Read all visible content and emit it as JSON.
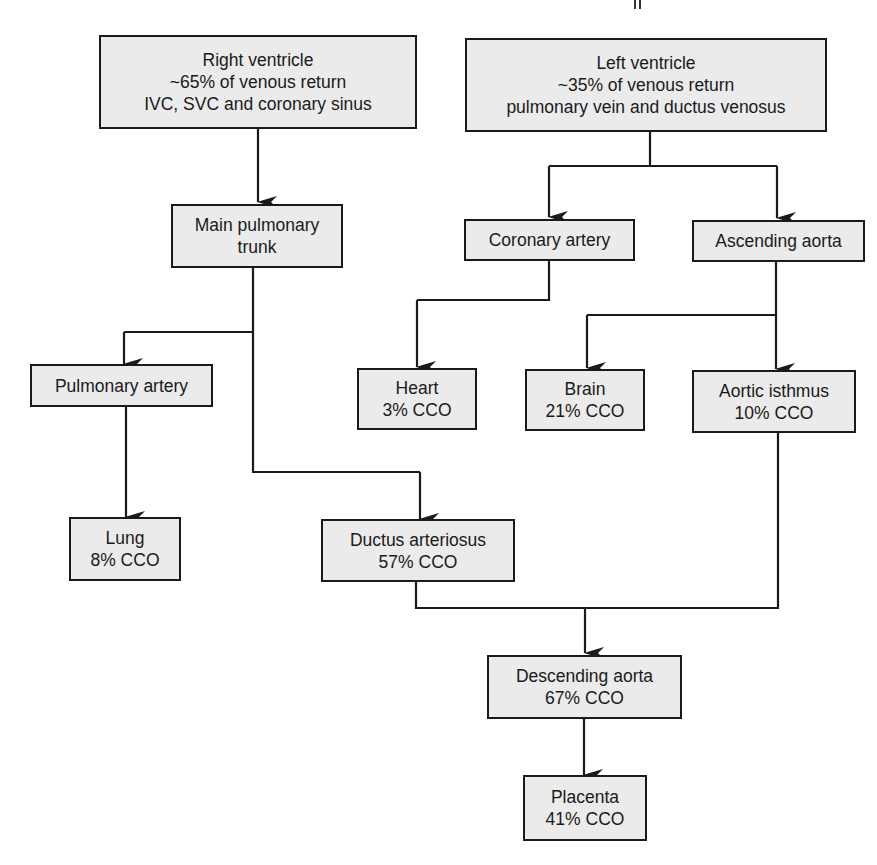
{
  "diagram": {
    "type": "flowchart",
    "topic": "Fetal circulation - distribution of combined cardiac output",
    "colors": {
      "box_fill": "#ebebeb",
      "box_border": "#1a1a1a",
      "line": "#1a1a1a",
      "text": "#1a1a1a",
      "background": "#ffffff"
    },
    "nodes": {
      "right_ventricle": {
        "lines": [
          "Right ventricle",
          "~65% of venous return",
          "IVC, SVC and coronary sinus"
        ]
      },
      "left_ventricle": {
        "lines": [
          "Left ventricle",
          "~35% of venous return",
          "pulmonary vein and ductus venosus"
        ]
      },
      "main_pulmonary_trunk": {
        "lines": [
          "Main pulmonary",
          "trunk"
        ]
      },
      "coronary_artery": {
        "lines": [
          "Coronary artery"
        ]
      },
      "ascending_aorta": {
        "lines": [
          "Ascending aorta"
        ]
      },
      "pulmonary_artery": {
        "lines": [
          "Pulmonary artery"
        ]
      },
      "heart": {
        "lines": [
          "Heart",
          "3% CCO"
        ]
      },
      "brain": {
        "lines": [
          "Brain",
          "21% CCO"
        ]
      },
      "aortic_isthmus": {
        "lines": [
          "Aortic isthmus",
          "10% CCO"
        ]
      },
      "lung": {
        "lines": [
          "Lung",
          "8% CCO"
        ]
      },
      "ductus_arteriosus": {
        "lines": [
          "Ductus arteriosus",
          "57% CCO"
        ]
      },
      "descending_aorta": {
        "lines": [
          "Descending aorta",
          "67% CCO"
        ]
      },
      "placenta": {
        "lines": [
          "Placenta",
          "41% CCO"
        ]
      }
    },
    "edges": [
      {
        "from": "right_ventricle",
        "to": "main_pulmonary_trunk"
      },
      {
        "from": "left_ventricle",
        "to": "coronary_artery"
      },
      {
        "from": "left_ventricle",
        "to": "ascending_aorta"
      },
      {
        "from": "main_pulmonary_trunk",
        "to": "pulmonary_artery"
      },
      {
        "from": "main_pulmonary_trunk",
        "to": "ductus_arteriosus"
      },
      {
        "from": "coronary_artery",
        "to": "heart"
      },
      {
        "from": "ascending_aorta",
        "to": "brain"
      },
      {
        "from": "ascending_aorta",
        "to": "aortic_isthmus"
      },
      {
        "from": "pulmonary_artery",
        "to": "lung"
      },
      {
        "from": "ductus_arteriosus",
        "to": "descending_aorta"
      },
      {
        "from": "aortic_isthmus",
        "to": "descending_aorta"
      },
      {
        "from": "descending_aorta",
        "to": "placenta"
      }
    ]
  }
}
